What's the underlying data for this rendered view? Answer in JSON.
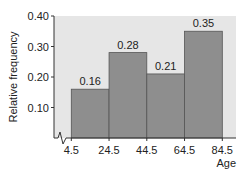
{
  "chart_data": {
    "type": "bar",
    "subtype": "histogram",
    "title": "",
    "xlabel": "Age",
    "ylabel": "Relative frequency",
    "bin_edges": [
      4.5,
      24.5,
      44.5,
      64.5,
      84.5
    ],
    "x_tick_labels": [
      "4.5",
      "24.5",
      "44.5",
      "64.5",
      "84.5"
    ],
    "values": [
      0.16,
      0.28,
      0.21,
      0.35
    ],
    "data_labels": [
      "0.16",
      "0.28",
      "0.21",
      "0.35"
    ],
    "y_ticks": [
      0.1,
      0.2,
      0.3,
      0.4
    ],
    "y_tick_labels": [
      "0.10",
      "0.20",
      "0.30",
      "0.40"
    ],
    "ylim": [
      0,
      0.4
    ],
    "x_axis_break": true,
    "grid": false,
    "colors": {
      "bar": "#8e8e8e",
      "plot_background": "#e6e6e6",
      "bar_edge": "#555555"
    }
  }
}
